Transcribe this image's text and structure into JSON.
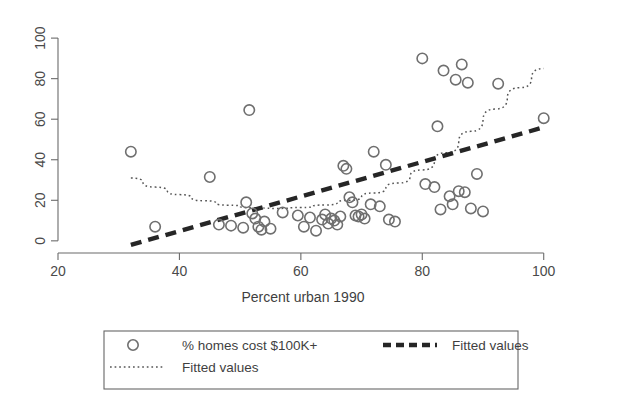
{
  "chart_data": {
    "type": "scatter",
    "title": "",
    "xlabel": "Percent urban 1990",
    "ylabel": "",
    "xlim": [
      20,
      104
    ],
    "ylim": [
      -6,
      104
    ],
    "xticks": [
      20,
      40,
      60,
      80,
      100
    ],
    "yticks": [
      0,
      20,
      40,
      60,
      80,
      100
    ],
    "xtick_labels": [
      "20",
      "40",
      "60",
      "80",
      "100"
    ],
    "ytick_labels": [
      "0",
      "20",
      "40",
      "60",
      "80",
      "100"
    ],
    "grid": false,
    "y_tick_label_rotation": -90,
    "legend_position": "below-axes",
    "series": [
      {
        "name": "% homes cost $100K+",
        "type": "scatter",
        "marker": "open-circle",
        "color": "#6f6f6f",
        "points": [
          [
            32.0,
            44.0
          ],
          [
            36.0,
            7.0
          ],
          [
            45.0,
            31.5
          ],
          [
            46.5,
            8.0
          ],
          [
            48.5,
            7.5
          ],
          [
            50.5,
            6.5
          ],
          [
            51.0,
            19.0
          ],
          [
            51.5,
            64.5
          ],
          [
            52.0,
            13.5
          ],
          [
            52.5,
            11.0
          ],
          [
            53.0,
            7.0
          ],
          [
            53.5,
            5.5
          ],
          [
            54.0,
            9.5
          ],
          [
            55.0,
            6.0
          ],
          [
            57.0,
            14.0
          ],
          [
            59.5,
            12.5
          ],
          [
            60.5,
            7.0
          ],
          [
            61.5,
            11.5
          ],
          [
            62.5,
            5.0
          ],
          [
            63.5,
            10.5
          ],
          [
            64.0,
            13.0
          ],
          [
            64.5,
            8.5
          ],
          [
            65.0,
            11.0
          ],
          [
            65.5,
            10.0
          ],
          [
            66.0,
            8.0
          ],
          [
            66.5,
            12.0
          ],
          [
            67.0,
            37.0
          ],
          [
            67.5,
            35.5
          ],
          [
            68.0,
            21.5
          ],
          [
            68.5,
            19.0
          ],
          [
            69.0,
            12.5
          ],
          [
            69.5,
            12.0
          ],
          [
            70.0,
            13.0
          ],
          [
            70.5,
            11.0
          ],
          [
            71.5,
            18.0
          ],
          [
            72.0,
            44.0
          ],
          [
            73.0,
            17.0
          ],
          [
            74.0,
            37.5
          ],
          [
            74.5,
            10.5
          ],
          [
            75.5,
            9.5
          ],
          [
            80.0,
            90.0
          ],
          [
            80.5,
            28.0
          ],
          [
            82.0,
            26.5
          ],
          [
            82.5,
            56.5
          ],
          [
            83.5,
            84.0
          ],
          [
            83.0,
            15.5
          ],
          [
            84.5,
            22.0
          ],
          [
            85.0,
            18.0
          ],
          [
            85.5,
            79.5
          ],
          [
            86.5,
            87.0
          ],
          [
            86.0,
            24.5
          ],
          [
            87.0,
            24.0
          ],
          [
            87.5,
            78.0
          ],
          [
            88.0,
            16.0
          ],
          [
            89.0,
            33.0
          ],
          [
            90.0,
            14.5
          ],
          [
            92.5,
            77.5
          ],
          [
            100.0,
            60.5
          ]
        ]
      },
      {
        "name": "Fitted values",
        "type": "line",
        "style": "dashed",
        "color": "#262626",
        "description": "linear fit rising from about -2 at x=32 to about 56 at x=100",
        "points": [
          [
            32.0,
            -2.0
          ],
          [
            100.0,
            56.0
          ]
        ]
      },
      {
        "name": "Fitted values",
        "type": "line",
        "style": "dotted",
        "color": "#555555",
        "description": "quadratic fit: falls from about 31 at x=32 to a minimum near 16 at x=55 then rises to about 85 at x=100",
        "points": [
          [
            32.0,
            31.0
          ],
          [
            36.0,
            26.5
          ],
          [
            40.0,
            22.8
          ],
          [
            44.0,
            19.8
          ],
          [
            48.0,
            17.6
          ],
          [
            52.0,
            16.3
          ],
          [
            56.0,
            16.0
          ],
          [
            60.0,
            16.4
          ],
          [
            64.0,
            17.7
          ],
          [
            68.0,
            20.0
          ],
          [
            72.0,
            23.6
          ],
          [
            76.0,
            28.5
          ],
          [
            80.0,
            35.0
          ],
          [
            84.0,
            43.5
          ],
          [
            88.0,
            54.0
          ],
          [
            92.0,
            65.0
          ],
          [
            96.0,
            75.5
          ],
          [
            100.0,
            85.0
          ]
        ]
      }
    ],
    "legend_entries": [
      {
        "label": "% homes cost $100K+",
        "marker": "open-circle"
      },
      {
        "label": "Fitted values",
        "marker": "dashed-line"
      },
      {
        "label": "Fitted values",
        "marker": "dotted-line"
      }
    ]
  }
}
